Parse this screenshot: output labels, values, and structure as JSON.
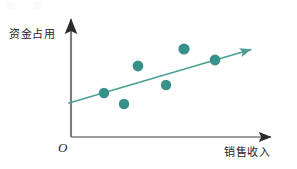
{
  "figure": {
    "background_color": "#ffffff",
    "width": 297,
    "height": 169
  },
  "labels": {
    "y_axis": "资金占用",
    "x_axis": "销售收入",
    "origin": "O"
  },
  "colors": {
    "point": "#389188",
    "trend_line": "#4a9e95",
    "axis": "#6e6e6e",
    "axis_arrow": "#2b2b2b",
    "text": "#1d1d1d"
  },
  "chart_data": {
    "type": "scatter",
    "title": "",
    "xlabel": "销售收入",
    "ylabel": "资金占用",
    "grid": false,
    "legend": null,
    "axis_style": "arrow-headed half axes with origin O",
    "xlim": [
      0,
      10
    ],
    "ylim": [
      0,
      10
    ],
    "points": [
      {
        "x": 1.8,
        "y": 3.4
      },
      {
        "x": 2.8,
        "y": 2.6
      },
      {
        "x": 3.8,
        "y": 5.8
      },
      {
        "x": 5.2,
        "y": 4.3
      },
      {
        "x": 6.4,
        "y": 7.2
      },
      {
        "x": 7.9,
        "y": 6.3
      }
    ],
    "pixel_points": [
      {
        "cx": 104,
        "cy": 93,
        "r": 5.2
      },
      {
        "cx": 124,
        "cy": 104,
        "r": 5.2
      },
      {
        "cx": 138,
        "cy": 66,
        "r": 5.4
      },
      {
        "cx": 166,
        "cy": 85,
        "r": 5.2
      },
      {
        "cx": 184,
        "cy": 49,
        "r": 5.6
      },
      {
        "cx": 215,
        "cy": 60,
        "r": 5.4
      }
    ],
    "trend_line": {
      "label": "positive correlation trend",
      "has_arrow_head": true,
      "start": {
        "x": 69,
        "y": 103
      },
      "end": {
        "x": 256,
        "y": 48
      }
    },
    "axes": {
      "origin_px": {
        "x": 71,
        "y": 137
      },
      "y_axis_top_px": {
        "x": 71,
        "y": 15
      },
      "x_axis_right_px": {
        "x": 277,
        "y": 137
      }
    }
  }
}
